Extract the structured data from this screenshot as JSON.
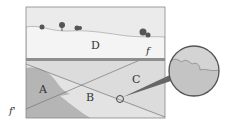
{
  "diagram": {
    "type": "geologic cross-section",
    "labels": {
      "D": "D",
      "C": "C",
      "B": "B",
      "A": "A",
      "fault_top": "f",
      "fault_bottom": "f'"
    },
    "colors": {
      "sky": "#e9e9e9",
      "layer_D": "#f2f2f2",
      "layer_C": "#d9d9d9",
      "layer_B": "#e1e1e1",
      "layer_A": "#b3b3b3",
      "unconformity": "#8a8a8a",
      "magnifier_fill": "#d0d0d0",
      "border": "#555555"
    }
  }
}
